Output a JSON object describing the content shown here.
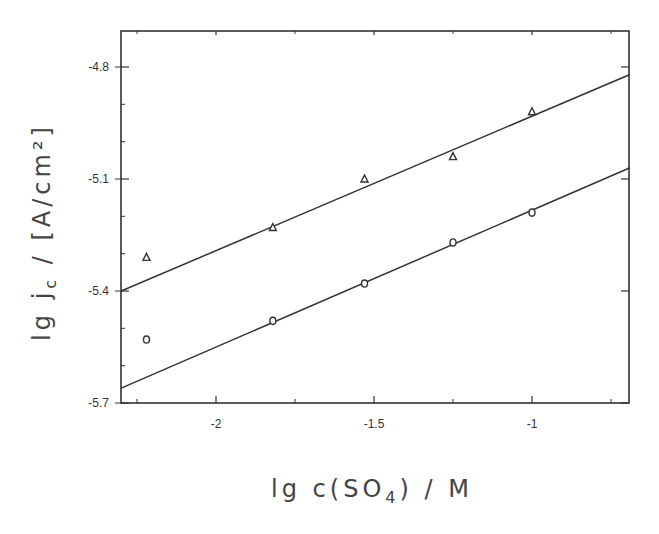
{
  "chart_data": {
    "type": "scatter",
    "title": "",
    "xlabel": "lg c(SO4) / M",
    "xlabel_parts": {
      "pre": "lg c(SO",
      "sub": "4",
      "post": ") / M"
    },
    "ylabel": "lg jc / [A/cm²]",
    "ylabel_parts": {
      "pre": "lg j",
      "sub": "c",
      "post": " / [A/cm²]"
    },
    "xlim": [
      -2.3,
      -0.69
    ],
    "ylim": [
      -5.7,
      -4.7
    ],
    "x_ticks": [
      -2,
      -1.5,
      -1
    ],
    "x_tick_labels": [
      "-2",
      "-1.5",
      "-1"
    ],
    "x_minor_ticks": [
      -2.25,
      -1.75,
      -1.25,
      -0.75
    ],
    "y_ticks": [
      -4.8,
      -5.1,
      -5.4,
      -5.7
    ],
    "y_tick_labels": [
      "-4.8",
      "-5.1",
      "-5.4",
      "-5.7"
    ],
    "grid": false,
    "legend": null,
    "series": [
      {
        "name": "triangles",
        "marker": "triangle",
        "x": [
          -2.22,
          -1.82,
          -1.53,
          -1.25,
          -1.0
        ],
        "y": [
          -5.31,
          -5.23,
          -5.1,
          -5.04,
          -4.92
        ],
        "fit_line": {
          "x": [
            -2.3,
            -0.69
          ],
          "y": [
            -5.4,
            -4.82
          ]
        }
      },
      {
        "name": "circles",
        "marker": "circle",
        "x": [
          -2.22,
          -1.82,
          -1.53,
          -1.25,
          -1.0
        ],
        "y": [
          -5.53,
          -5.48,
          -5.38,
          -5.27,
          -5.19
        ],
        "fit_line": {
          "x": [
            -2.3,
            -0.69
          ],
          "y": [
            -5.66,
            -5.07
          ]
        }
      }
    ]
  }
}
